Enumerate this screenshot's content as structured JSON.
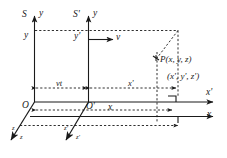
{
  "figure": {
    "type": "physics-coordinate-diagram",
    "background_color": "#ffffff",
    "line_color": "#1a1a1a",
    "width": 227,
    "height": 158
  },
  "labels": {
    "frame_s": "S",
    "frame_s_prime": "S'",
    "axis_y_s": "y",
    "axis_y_s_prime": "y",
    "height_y": "y",
    "height_y_prime": "y'",
    "velocity": "v",
    "origin_o": "O",
    "origin_o_prime": "O'",
    "distance_vt": "vt",
    "distance_x_prime": "x'",
    "distance_x": "x",
    "axis_x_prime": "x'",
    "axis_x": "x",
    "axis_z_s_upper": "z",
    "axis_z_s_lower": "z",
    "axis_z_prime_upper": "z'",
    "axis_z_prime_lower": "z'",
    "point_label_unprimed": "P(x, y, z)",
    "point_label_primed": "(x', y', z')"
  }
}
